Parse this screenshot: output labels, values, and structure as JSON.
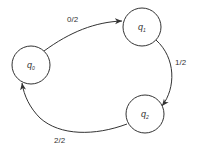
{
  "diagram": {
    "type": "state-machine",
    "states": [
      {
        "id": "q0",
        "label": "q",
        "subscript": "0"
      },
      {
        "id": "q1",
        "label": "q",
        "subscript": "1"
      },
      {
        "id": "q2",
        "label": "q",
        "subscript": "2"
      }
    ],
    "transitions": [
      {
        "from": "q0",
        "to": "q1",
        "label": "0/2"
      },
      {
        "from": "q1",
        "to": "q2",
        "label": "1/2"
      },
      {
        "from": "q2",
        "to": "q0",
        "label": "2/2"
      }
    ],
    "colors": {
      "stroke": "#333333",
      "background": "#ffffff"
    }
  }
}
